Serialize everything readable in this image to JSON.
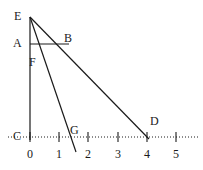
{
  "figure": {
    "type": "geometry-diagram",
    "width": 203,
    "height": 170,
    "stroke_color": "#1a1a1a",
    "background": "#ffffff"
  },
  "axis": {
    "name": "number-line",
    "style": "dotted",
    "y": 137,
    "x_start": 8,
    "x_end": 199,
    "origin_x": 30,
    "unit_px": 29.2,
    "ticks": [
      {
        "label": "0",
        "value": 0,
        "x": 30
      },
      {
        "label": "1",
        "value": 1,
        "x": 59
      },
      {
        "label": "2",
        "value": 2,
        "x": 88
      },
      {
        "label": "3",
        "value": 3,
        "x": 118
      },
      {
        "label": "4",
        "value": 4,
        "x": 147
      },
      {
        "label": "5",
        "value": 5,
        "x": 176
      }
    ]
  },
  "points": [
    {
      "id": "E",
      "label": "E",
      "x": 30,
      "y": 17,
      "label_x": 14,
      "label_y": 10
    },
    {
      "id": "A",
      "label": "A",
      "x": 30,
      "y": 44,
      "label_x": 13,
      "label_y": 37
    },
    {
      "id": "B",
      "label": "B",
      "x": 65,
      "y": 44,
      "label_x": 64,
      "label_y": 32
    },
    {
      "id": "F",
      "label": "F",
      "x": 30,
      "y": 62,
      "label_x": 29,
      "label_y": 56
    },
    {
      "id": "C",
      "label": "C",
      "x": 30,
      "y": 137,
      "label_x": 13,
      "label_y": 130
    },
    {
      "id": "G",
      "label": "G",
      "x": 71,
      "y": 137,
      "label_x": 70,
      "label_y": 124
    },
    {
      "id": "D",
      "label": "D",
      "x": 147,
      "y": 137,
      "label_x": 150,
      "label_y": 115
    }
  ],
  "segments": [
    {
      "name": "segment-EC",
      "from": "E",
      "to": "C",
      "x1": 30,
      "y1": 17,
      "x2": 30,
      "y2": 140
    },
    {
      "name": "segment-EG-extended",
      "from": "E",
      "to": "below-G",
      "x1": 30,
      "y1": 17,
      "x2": 76,
      "y2": 152
    },
    {
      "name": "segment-ED",
      "from": "E",
      "to": "D",
      "x1": 30,
      "y1": 17,
      "x2": 149,
      "y2": 139
    },
    {
      "name": "segment-AB",
      "from": "A",
      "to": "B",
      "x1": 30,
      "y1": 44,
      "x2": 69,
      "y2": 44
    }
  ]
}
